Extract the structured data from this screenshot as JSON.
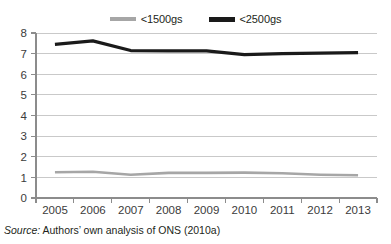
{
  "legend": {
    "position": "top-center",
    "entries": [
      {
        "label": "<1500gs",
        "color": "#a6a6a6",
        "marker": "line-swatch-gray"
      },
      {
        "label": "<2500gs",
        "color": "#1a1a1a",
        "marker": "line-swatch-black"
      }
    ]
  },
  "source_note": {
    "lead": "Source:",
    "text": " Authors’ own analysis of ONS (2010a)"
  },
  "axes": {
    "y_ticks": [
      "8",
      "7",
      "6",
      "5",
      "4",
      "3",
      "2",
      "1",
      "0"
    ],
    "x_ticks": [
      "2005",
      "2006",
      "2007",
      "2008",
      "2009",
      "2010",
      "2011",
      "2012",
      "2013"
    ]
  },
  "chart_data": {
    "type": "line",
    "title": "",
    "subtitle": "",
    "xlabel": "",
    "ylabel": "",
    "categories": [
      "2005",
      "2006",
      "2007",
      "2008",
      "2009",
      "2010",
      "2011",
      "2012",
      "2013"
    ],
    "x": [
      2005,
      2006,
      2007,
      2008,
      2009,
      2010,
      2011,
      2012,
      2013
    ],
    "series": [
      {
        "name": "<1500gs",
        "color": "#a6a6a6",
        "values": [
          1.25,
          1.27,
          1.13,
          1.22,
          1.22,
          1.23,
          1.2,
          1.13,
          1.1
        ]
      },
      {
        "name": "<2500gs",
        "color": "#1a1a1a",
        "values": [
          7.45,
          7.62,
          7.15,
          7.13,
          7.13,
          6.95,
          7.0,
          7.02,
          7.05
        ]
      }
    ],
    "ylim": [
      0,
      8
    ],
    "ytick_step": 1,
    "xlim": [
      "2005",
      "2013"
    ],
    "grid": "horizontal",
    "grid_color": "#c9c9c9",
    "legend_position": "top-center"
  }
}
